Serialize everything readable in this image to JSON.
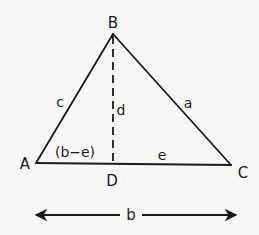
{
  "diagram": {
    "colors": {
      "stroke": "#1a1a1a",
      "background": "#f7f7f5"
    },
    "vertices": {
      "A": {
        "label": "A",
        "x": 36,
        "y": 163
      },
      "B": {
        "label": "B",
        "x": 113,
        "y": 34
      },
      "C": {
        "label": "C",
        "x": 231,
        "y": 165
      },
      "D": {
        "label": "D",
        "x": 113,
        "y": 164
      }
    },
    "labels": {
      "A": "A",
      "B": "B",
      "C": "C",
      "D": "D",
      "side_c": "c",
      "side_a": "a",
      "altitude_d": "d",
      "segment_b_minus_e": "(b−e)",
      "segment_e": "e",
      "base_b": "b"
    },
    "edges": [
      {
        "from": "A",
        "to": "B",
        "name": "c",
        "style": "solid"
      },
      {
        "from": "B",
        "to": "C",
        "name": "a",
        "style": "solid"
      },
      {
        "from": "A",
        "to": "C",
        "name": "b",
        "style": "solid"
      },
      {
        "from": "B",
        "to": "D",
        "name": "d",
        "style": "dashed"
      }
    ],
    "dimension_arrow": {
      "label": "b",
      "x1": 35,
      "x2": 237,
      "y": 215
    }
  }
}
